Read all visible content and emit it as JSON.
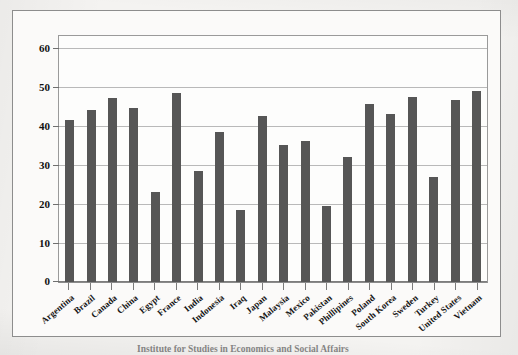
{
  "chart_data": {
    "type": "bar",
    "title": "",
    "xlabel": "",
    "ylabel": "",
    "ylim": [
      0,
      63
    ],
    "grid": true,
    "legend": "none",
    "y_ticks": [
      0,
      10,
      20,
      30,
      40,
      50,
      60
    ],
    "categories": [
      "Argentina",
      "Brazil",
      "Canada",
      "China",
      "Egypt",
      "France",
      "India",
      "Indonesia",
      "Iraq",
      "Japan",
      "Malaysia",
      "Mexico",
      "Pakistan",
      "Phillipines",
      "Poland",
      "South Korea",
      "Sweden",
      "Turkey",
      "United States",
      "Vietnam"
    ],
    "values": [
      41.5,
      44.0,
      47.0,
      44.5,
      23.0,
      48.5,
      28.5,
      38.5,
      18.5,
      42.5,
      35.0,
      36.0,
      19.5,
      32.0,
      45.5,
      43.0,
      47.5,
      27.0,
      46.5,
      49.0
    ],
    "bar_color": "#565656",
    "plot_background": "#fdfdfc",
    "gridline_color": "#b9b9b9"
  },
  "caption": {
    "text": "Institute for Studies in Economics and Social Affairs"
  }
}
